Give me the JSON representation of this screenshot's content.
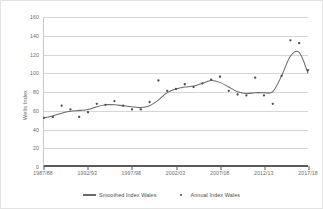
{
  "chart_data": {
    "type": "scatter",
    "title": "",
    "xlabel": "",
    "ylabel": "Wells Index",
    "ylim": [
      0,
      160
    ],
    "ytick_values": [
      0,
      20,
      40,
      60,
      80,
      100,
      120,
      140,
      160
    ],
    "ytick_labels": [
      "0",
      "20",
      "40",
      "60",
      "80",
      "100",
      "120",
      "140",
      "160"
    ],
    "grid": true,
    "grid_axis": "y",
    "legend_position": "bottom-center",
    "x": [
      "1987/88",
      "1988/89",
      "1989/90",
      "1990/91",
      "1991/92",
      "1992/93",
      "1993/94",
      "1994/95",
      "1995/96",
      "1996/97",
      "1997/98",
      "1998/99",
      "1999/00",
      "2000/01",
      "2001/02",
      "2002/03",
      "2003/04",
      "2004/05",
      "2005/06",
      "2006/07",
      "2007/08",
      "2008/09",
      "2009/10",
      "2010/11",
      "2011/12",
      "2012/13",
      "2013/14",
      "2014/15",
      "2015/16",
      "2016/17",
      "2017/18"
    ],
    "xtick_labels": [
      "1987/88",
      "1992/93",
      "1997/98",
      "2002/03",
      "2007/08",
      "2012/13",
      "2017/18"
    ],
    "xtick_indices": [
      0,
      5,
      10,
      15,
      20,
      25,
      30
    ],
    "series": [
      {
        "name": "Annual Index Wales",
        "marker": "dot",
        "color": "#4a4a4a",
        "values": [
          52,
          53,
          65,
          61,
          53,
          58,
          67,
          66,
          70,
          65,
          61,
          61,
          69,
          92,
          81,
          83,
          88,
          85,
          89,
          93,
          96,
          81,
          77,
          76,
          95,
          76,
          67,
          97,
          135,
          132,
          103
        ]
      },
      {
        "name": "Smoothed Index Wales",
        "marker": "line",
        "color": "#6a6a6a",
        "values": [
          52,
          54,
          57,
          59,
          60,
          61,
          64,
          66,
          66,
          65,
          64,
          63,
          65,
          71,
          79,
          83,
          85,
          86,
          89,
          92,
          90,
          85,
          80,
          78,
          79,
          79,
          80,
          97,
          118,
          122,
          100
        ]
      }
    ]
  },
  "legend": {
    "items": [
      {
        "label": "Smoothed Index Wales",
        "marker": "line"
      },
      {
        "label": "Annual Index Wales",
        "marker": "dot"
      }
    ]
  }
}
